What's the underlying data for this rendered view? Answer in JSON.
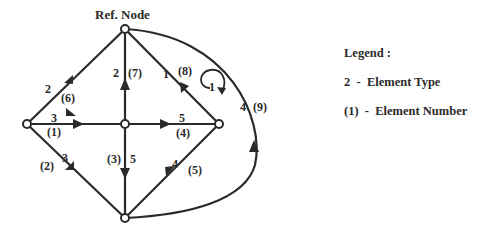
{
  "diagram": {
    "title": "Ref. Node",
    "nodes": [
      {
        "id": "ref",
        "x": 125,
        "y": 29
      },
      {
        "id": "left",
        "x": 27,
        "y": 124
      },
      {
        "id": "center",
        "x": 125,
        "y": 124
      },
      {
        "id": "right",
        "x": 219,
        "y": 124
      },
      {
        "id": "bottom",
        "x": 125,
        "y": 218
      }
    ],
    "edges": [
      {
        "number": "(1)",
        "type": "3",
        "from": "left",
        "to": "center"
      },
      {
        "number": "(2)",
        "type": "3",
        "from": "left",
        "to": "bottom"
      },
      {
        "number": "(3)",
        "type": "5",
        "from": "center",
        "to": "bottom"
      },
      {
        "number": "(4)",
        "type": "5",
        "from": "center",
        "to": "right"
      },
      {
        "number": "(5)",
        "type": "4",
        "from": "bottom",
        "to": "right"
      },
      {
        "number": "(6)",
        "type": "2",
        "from": "left",
        "to": "ref"
      },
      {
        "number": "(7)",
        "type": "2",
        "from": "center",
        "to": "ref"
      },
      {
        "number": "(8)",
        "type": "1",
        "from": "right",
        "to": "ref"
      },
      {
        "number": "(9)",
        "type": "4",
        "from": "bottom",
        "to": "ref"
      }
    ],
    "loop_label": "1",
    "labels": {
      "e1_type": "3",
      "e1_num": "(1)",
      "e2_type": "3",
      "e2_num": "(2)",
      "e3_type": "5",
      "e3_num": "(3)",
      "e4_type": "5",
      "e4_num": "(4)",
      "e5_type": "4",
      "e5_num": "(5)",
      "e6_type": "2",
      "e6_num": "(6)",
      "e7_type": "2",
      "e7_num": "(7)",
      "e8_type": "1",
      "e8_num": "(8)",
      "e9_type": "4",
      "e9_num": "(9)"
    }
  },
  "legend": {
    "title": "Legend :",
    "items": [
      {
        "text": "2  -  Element Type"
      },
      {
        "text": "(1)  -  Element Number"
      }
    ]
  },
  "colors": {
    "line": "#2a2a2a",
    "background": "#ffffff"
  }
}
